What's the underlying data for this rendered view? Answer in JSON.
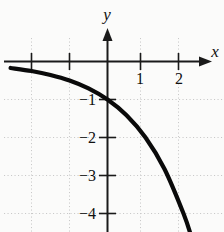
{
  "chart_data": {
    "type": "line",
    "title": "",
    "subtitle": "",
    "xlabel": "x",
    "ylabel": "y",
    "xlim": [
      -2.8,
      2.7
    ],
    "ylim": [
      -4.6,
      0.8
    ],
    "grid": true,
    "grid_style": "dotted",
    "legend": null,
    "axis_arrows": [
      "x-positive",
      "y-positive"
    ],
    "x_ticks": [
      -2,
      -1,
      1,
      2
    ],
    "x_tick_labels": [
      "",
      "",
      "1",
      "2"
    ],
    "y_ticks": [
      -1,
      -2,
      -3,
      -4
    ],
    "y_tick_labels": [
      "−1",
      "−2",
      "−3",
      "−4"
    ],
    "series": [
      {
        "name": "y = -2^x",
        "stroke": "#0a0a0a",
        "points": [
          {
            "x": -2.55,
            "y": -0.17
          },
          {
            "x": -2.0,
            "y": -0.25
          },
          {
            "x": -1.5,
            "y": -0.354
          },
          {
            "x": -1.0,
            "y": -0.5
          },
          {
            "x": -0.5,
            "y": -0.707
          },
          {
            "x": 0.0,
            "y": -1.0
          },
          {
            "x": 0.5,
            "y": -1.414
          },
          {
            "x": 1.0,
            "y": -2.0
          },
          {
            "x": 1.5,
            "y": -2.828
          },
          {
            "x": 2.0,
            "y": -4.0
          },
          {
            "x": 2.2,
            "y": -4.59
          }
        ]
      }
    ],
    "annotations": []
  },
  "labels": {
    "x_axis": "x",
    "y_axis": "y",
    "tick_x_1": "1",
    "tick_x_2": "2",
    "tick_y_1": "−1",
    "tick_y_2": "−2",
    "tick_y_3": "−3",
    "tick_y_4": "−4"
  },
  "colors": {
    "background": "#fbfbfa",
    "axis": "#1a1a1a",
    "curve": "#0a0a0a",
    "grid": "#c9c9c9",
    "text": "#101010"
  }
}
